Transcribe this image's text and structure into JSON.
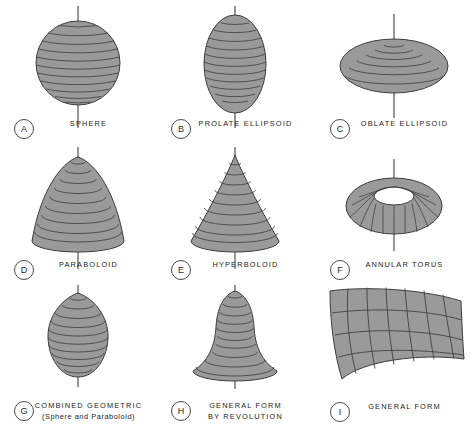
{
  "figure": {
    "background": "#ffffff",
    "surface_fill": "#9a9a9a",
    "surface_stroke": "#3c3c3c",
    "axis_color": "#2e2e2e",
    "badge_stroke": "#4a4a4a",
    "text_color": "#1c1c1c"
  },
  "items": [
    {
      "key": "A",
      "label": "SPHERE",
      "sublabel": "",
      "shape": "sphere",
      "axis": true,
      "rings": 13,
      "mesh": "horizontal"
    },
    {
      "key": "B",
      "label": "PROLATE ELLIPSOID",
      "sublabel": "",
      "shape": "prolate-ellipsoid",
      "axis": true,
      "rings": 13,
      "mesh": "horizontal"
    },
    {
      "key": "C",
      "label": "OBLATE ELLIPSOID",
      "sublabel": "",
      "shape": "oblate-ellipsoid",
      "axis": true,
      "rings": 8,
      "mesh": "horizontal"
    },
    {
      "key": "D",
      "label": "PARABOLOID",
      "sublabel": "",
      "shape": "paraboloid",
      "axis": true,
      "rings": 10,
      "mesh": "horizontal"
    },
    {
      "key": "E",
      "label": "HYPERBOLOID",
      "sublabel": "",
      "shape": "hyperboloid",
      "axis": true,
      "rings": 10,
      "mesh": "horizontal"
    },
    {
      "key": "F",
      "label": "ANNULAR TORUS",
      "sublabel": "",
      "shape": "annular-torus",
      "axis": true,
      "rings": 16,
      "mesh": "meridian"
    },
    {
      "key": "G",
      "label": "COMBINED GEOMETRIC",
      "sublabel": "(Sphere and Paraboloid)",
      "shape": "combined-geometric",
      "axis": true,
      "rings": 11,
      "mesh": "horizontal"
    },
    {
      "key": "H",
      "label": "GENERAL FORM",
      "sublabel": "BY REVOLUTION",
      "shape": "general-form-revolution",
      "axis": true,
      "rings": 11,
      "mesh": "horizontal"
    },
    {
      "key": "I",
      "label": "GENERAL FORM",
      "sublabel": "",
      "shape": "general-form-patch",
      "axis": false,
      "mesh": "grid",
      "grid_columns": 7,
      "grid_rows": 4
    }
  ]
}
